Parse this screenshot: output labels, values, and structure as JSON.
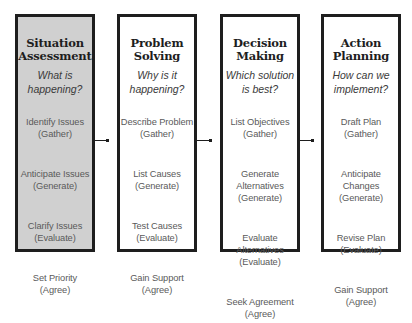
{
  "diagram": {
    "stages": [
      {
        "title": "Situation\nAssessment",
        "question": "What is\nhappening?",
        "highlighted": true,
        "steps": [
          {
            "action": "Identify Issues",
            "phase": "(Gather)"
          },
          {
            "action": "Anticipate Issues",
            "phase": "(Generate)"
          },
          {
            "action": "Clarify Issues",
            "phase": "(Evaluate)"
          },
          {
            "action": "Set Priority",
            "phase": "(Agree)"
          }
        ]
      },
      {
        "title": "Problem\nSolving",
        "question": "Why is it\nhappening?",
        "highlighted": false,
        "steps": [
          {
            "action": "Describe Problem",
            "phase": "(Gather)"
          },
          {
            "action": "List Causes",
            "phase": "(Generate)"
          },
          {
            "action": "Test Causes",
            "phase": "(Evaluate)"
          },
          {
            "action": "Gain Support",
            "phase": "(Agree)"
          }
        ]
      },
      {
        "title": "Decision\nMaking",
        "question": "Which solution\nis best?",
        "highlighted": false,
        "steps": [
          {
            "action": "List Objectives",
            "phase": "(Gather)"
          },
          {
            "action": "Generate\nAlternatives",
            "phase": "(Generate)"
          },
          {
            "action": "Evaluate\nAlternatives",
            "phase": "(Evaluate)"
          },
          {
            "action": "Seek Agreement",
            "phase": "(Agree)"
          }
        ]
      },
      {
        "title": "Action\nPlanning",
        "question": "How can we\nimplement?",
        "highlighted": false,
        "steps": [
          {
            "action": "Draft Plan",
            "phase": "(Gather)"
          },
          {
            "action": "Anticipate\nChanges",
            "phase": "(Generate)"
          },
          {
            "action": "Revise Plan",
            "phase": "(Evaluate)"
          },
          {
            "action": "Gain Support",
            "phase": "(Agree)"
          }
        ]
      }
    ],
    "colors": {
      "border": "#1e1e1e",
      "highlight_fill": "#d0d0d0",
      "default_fill": "#ffffff",
      "step_text": "#5a5a5a",
      "title_text": "#1e1e1e"
    }
  }
}
